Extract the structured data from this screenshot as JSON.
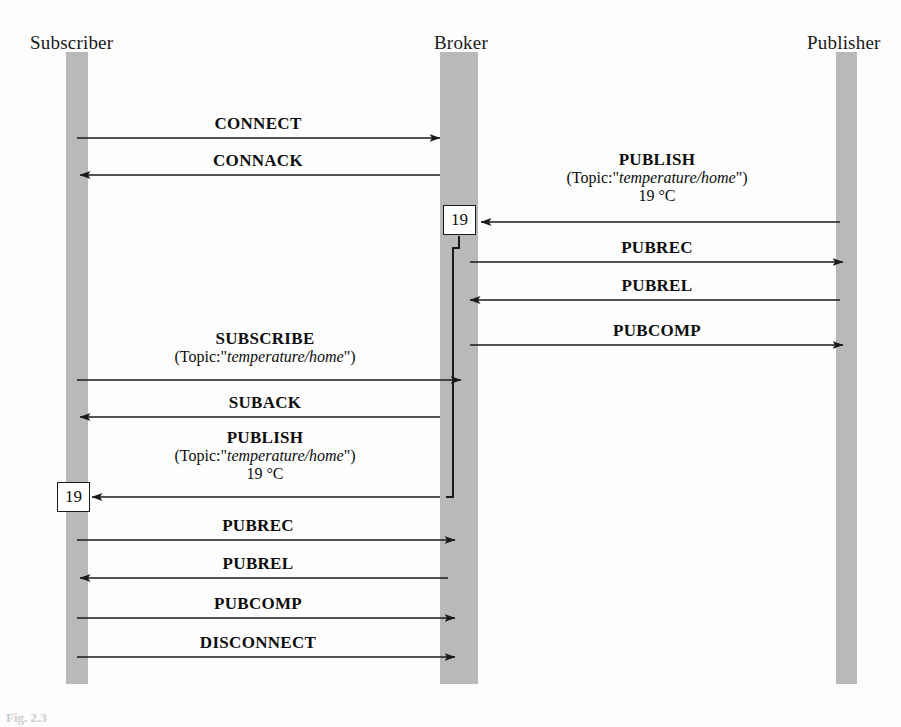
{
  "figure": {
    "type": "sequence-diagram",
    "caption": "Fig. 2.3",
    "background_color": "#fdfdfd",
    "lifeline_color": "#b9b9b9",
    "line_color": "#1a1a1a"
  },
  "participants": [
    {
      "id": "subscriber",
      "label": "Subscriber",
      "x": 77,
      "label_x": 72,
      "label_y": 44,
      "bar_x": 66,
      "bar_y": 52,
      "bar_w": 22,
      "bar_h": 632
    },
    {
      "id": "broker",
      "label": "Broker",
      "x": 459,
      "label_x": 468,
      "label_y": 44,
      "bar_x": 440,
      "bar_y": 52,
      "bar_w": 38,
      "bar_h": 632
    },
    {
      "id": "publisher",
      "label": "Publisher",
      "x": 846,
      "label_x": 845,
      "label_y": 44,
      "bar_x": 836,
      "bar_y": 52,
      "bar_w": 21,
      "bar_h": 632
    }
  ],
  "messages": [
    {
      "id": "connect",
      "label": "CONNECT",
      "from": "subscriber",
      "to": "broker",
      "direction": "right",
      "y": 138,
      "label_cx": 258,
      "label_y": 115
    },
    {
      "id": "connack",
      "label": "CONNACK",
      "from": "broker",
      "to": "subscriber",
      "direction": "left",
      "y": 175,
      "label_cx": 258,
      "label_y": 152
    },
    {
      "id": "publish-pub-broker",
      "label": "PUBLISH",
      "sub_prefix": "(Topic:\"",
      "sub_topic": "temperature/home",
      "sub_suffix": "\")",
      "value": "19 °C",
      "from": "publisher",
      "to": "broker",
      "direction": "left",
      "y": 222,
      "label_cx": 655,
      "label_y": 152
    },
    {
      "id": "pubrec-pub",
      "label": "PUBREC",
      "from": "broker",
      "to": "publisher",
      "direction": "right",
      "y": 262,
      "label_cx": 655,
      "label_y": 239
    },
    {
      "id": "pubrel-pub",
      "label": "PUBREL",
      "from": "publisher",
      "to": "broker",
      "direction": "left",
      "y": 300,
      "label_cx": 655,
      "label_y": 277
    },
    {
      "id": "pubcomp-pub",
      "label": "PUBCOMP",
      "from": "broker",
      "to": "publisher",
      "direction": "right",
      "y": 345,
      "label_cx": 655,
      "label_y": 322
    },
    {
      "id": "subscribe",
      "label": "SUBSCRIBE",
      "sub_prefix": "(Topic:\"",
      "sub_topic": "temperature/home",
      "sub_suffix": "\")",
      "from": "subscriber",
      "to": "broker",
      "direction": "right",
      "y": 380,
      "label_cx": 265,
      "label_y": 330
    },
    {
      "id": "suback",
      "label": "SUBACK",
      "from": "broker",
      "to": "subscriber",
      "direction": "left",
      "y": 417,
      "label_cx": 265,
      "label_y": 394
    },
    {
      "id": "publish-broker-sub",
      "label": "PUBLISH",
      "sub_prefix": "(Topic:\"",
      "sub_topic": "temperature/home",
      "sub_suffix": "\")",
      "value": "19 °C",
      "from": "broker",
      "to": "subscriber",
      "direction": "left",
      "y": 497,
      "label_cx": 265,
      "label_y": 429
    },
    {
      "id": "pubrec-sub",
      "label": "PUBREC",
      "from": "subscriber",
      "to": "broker",
      "direction": "right",
      "y": 540,
      "label_cx": 258,
      "label_y": 517
    },
    {
      "id": "pubrel-sub",
      "label": "PUBREL",
      "from": "broker",
      "to": "subscriber",
      "direction": "left",
      "y": 578,
      "label_cx": 258,
      "label_y": 555
    },
    {
      "id": "pubcomp-sub",
      "label": "PUBCOMP",
      "from": "subscriber",
      "to": "broker",
      "direction": "right",
      "y": 618,
      "label_cx": 258,
      "label_y": 595
    },
    {
      "id": "disconnect",
      "label": "DISCONNECT",
      "from": "subscriber",
      "to": "broker",
      "direction": "right",
      "y": 657,
      "label_cx": 258,
      "label_y": 634
    }
  ],
  "payload_boxes": [
    {
      "id": "payload-broker",
      "value": "19",
      "x": 443,
      "y": 205,
      "w": 33,
      "h": 30
    },
    {
      "id": "payload-subscriber",
      "value": "19",
      "x": 57,
      "y": 482,
      "w": 33,
      "h": 30
    }
  ],
  "retain_path": {
    "id": "stored-message-path",
    "description": "stored message routed from broker store down to subscriber PUBLISH",
    "points": "459,235 459,250 453,250 453,490 453,497 441,497"
  }
}
